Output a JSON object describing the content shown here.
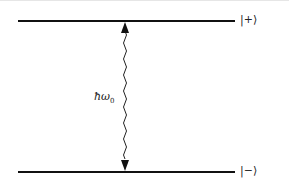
{
  "diagram": {
    "type": "two-level energy diagram",
    "upper_level": {
      "label": "|+⟩"
    },
    "lower_level": {
      "label": "|−⟩"
    },
    "transition": {
      "label_main": "ħω",
      "label_sub": "0",
      "style": "wavy double-headed arrow"
    },
    "colors": {
      "line": "#111111",
      "text": "#222222",
      "background": "#ffffff"
    }
  }
}
